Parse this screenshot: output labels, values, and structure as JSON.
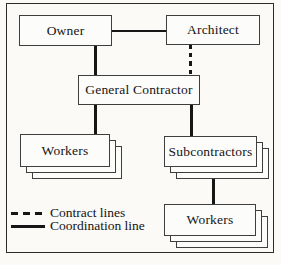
{
  "figure": {
    "background": "#fbfaf7",
    "line_color": "#161616",
    "box_border_color": "#3e3e3e",
    "box_fill": "#fcfcfa"
  },
  "nodes": {
    "owner": "Owner",
    "architect": "Architect",
    "general_contractor": "General Contractor",
    "workers_left": "Workers",
    "subcontractors": "Subcontractors",
    "workers_bottom": "Workers"
  },
  "edges": [
    {
      "from": "Owner",
      "to": "Architect",
      "type": "coordination",
      "style": "solid"
    },
    {
      "from": "Owner",
      "to": "General Contractor",
      "type": "coordination",
      "style": "solid"
    },
    {
      "from": "Architect",
      "to": "General Contractor",
      "type": "contract",
      "style": "dashed"
    },
    {
      "from": "General Contractor",
      "to": "Workers",
      "type": "coordination",
      "style": "solid"
    },
    {
      "from": "General Contractor",
      "to": "Subcontractors",
      "type": "coordination",
      "style": "solid"
    },
    {
      "from": "Subcontractors",
      "to": "Workers",
      "type": "coordination",
      "style": "solid"
    }
  ],
  "legend": {
    "contract_label": "Contract lines",
    "coordination_label": "Coordination line"
  }
}
